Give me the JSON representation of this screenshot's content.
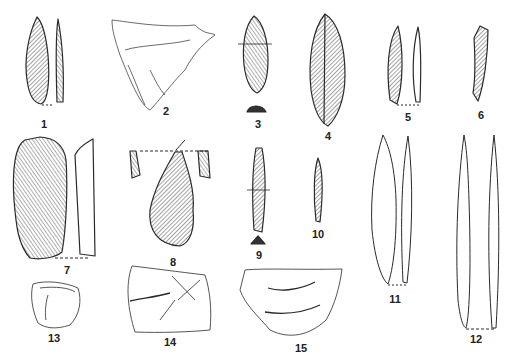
{
  "plate": {
    "description": "Plate of Upper Palaeolithic flint and bone artifacts, numbered 1-15",
    "ink_color": "#2a2a2a",
    "background": "#ffffff"
  },
  "figures": [
    {
      "id": "1",
      "label": "1",
      "x": 44,
      "y": 119,
      "kind": "laurel-leaf point with profile"
    },
    {
      "id": "2",
      "label": "2",
      "x": 166,
      "y": 114,
      "kind": "engraved fragment"
    },
    {
      "id": "3",
      "label": "3",
      "x": 262,
      "y": 125,
      "kind": "bifacial point with section"
    },
    {
      "id": "4",
      "label": "4",
      "x": 327,
      "y": 136,
      "kind": "blade"
    },
    {
      "id": "5",
      "label": "5",
      "x": 408,
      "y": 118,
      "kind": "backed bladelet with profile"
    },
    {
      "id": "6",
      "label": "6",
      "x": 481,
      "y": 117,
      "kind": "backed bladelet"
    },
    {
      "id": "7",
      "label": "7",
      "x": 67,
      "y": 269,
      "kind": "end-scraper with profile"
    },
    {
      "id": "8",
      "label": "8",
      "x": 173,
      "y": 260,
      "kind": "burin"
    },
    {
      "id": "9",
      "label": "9",
      "x": 259,
      "y": 253,
      "kind": "backed blade with section"
    },
    {
      "id": "10",
      "label": "10",
      "x": 318,
      "y": 233,
      "kind": "bladelet"
    },
    {
      "id": "11",
      "label": "11",
      "x": 395,
      "y": 299,
      "kind": "bone point with profile"
    },
    {
      "id": "12",
      "label": "12",
      "x": 475,
      "y": 339,
      "kind": "bone point with profile"
    },
    {
      "id": "13",
      "label": "13",
      "x": 54,
      "y": 337,
      "kind": "engraved pebble"
    },
    {
      "id": "14",
      "label": "14",
      "x": 170,
      "y": 341,
      "kind": "engraved stone"
    },
    {
      "id": "15",
      "label": "15",
      "x": 301,
      "y": 348,
      "kind": "engraved stone"
    }
  ]
}
